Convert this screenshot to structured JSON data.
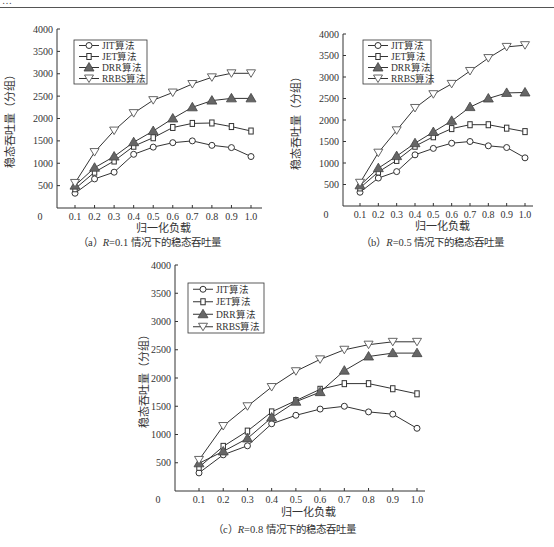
{
  "header": {
    "fragment": "…"
  },
  "legend_series": [
    "JIT算法",
    "JET算法",
    "DRR算法",
    "RRBS算法"
  ],
  "chart_data": [
    {
      "id": "a",
      "type": "line",
      "caption_prefix": "（a）",
      "caption_var": "R",
      "caption_rest": "=0.1 情况下的稳态吞吐量",
      "title": "(a) R=0.1 情况下的稳态吞吐量",
      "xlabel": "归一化负载",
      "ylabel": "稳态吞吐量（分组）",
      "x": [
        0.1,
        0.2,
        0.3,
        0.4,
        0.5,
        0.6,
        0.7,
        0.8,
        0.9,
        1.0
      ],
      "x_ticks": [
        "0.1",
        "0.2",
        "0.3",
        "0.4",
        "0.5",
        "0.6",
        "0.7",
        "0.8",
        "0.9",
        "1.0"
      ],
      "y_ticks": [
        "0",
        "500",
        "1000",
        "1500",
        "2000",
        "2500",
        "3000",
        "3500",
        "4000"
      ],
      "ylim": [
        0,
        4000
      ],
      "grid": false,
      "legend_position": "upper-left",
      "series": [
        {
          "name": "JIT算法",
          "marker": "circle",
          "values": [
            330,
            650,
            800,
            1200,
            1360,
            1460,
            1500,
            1400,
            1350,
            1150
          ]
        },
        {
          "name": "JET算法",
          "marker": "square",
          "values": [
            430,
            800,
            1050,
            1380,
            1570,
            1800,
            1890,
            1900,
            1820,
            1720
          ]
        },
        {
          "name": "DRR算法",
          "marker": "triangle-up",
          "values": [
            500,
            900,
            1150,
            1470,
            1720,
            2000,
            2250,
            2400,
            2450,
            2450
          ]
        },
        {
          "name": "RRBS算法",
          "marker": "triangle-down",
          "values": [
            560,
            1250,
            1730,
            2120,
            2410,
            2580,
            2770,
            2920,
            3010,
            3010
          ]
        }
      ]
    },
    {
      "id": "b",
      "type": "line",
      "caption_prefix": "（b）",
      "caption_var": "R",
      "caption_rest": "=0.5 情况下的稳态吞吐量",
      "title": "(b) R=0.5 情况下的稳态吞吐量",
      "xlabel": "归一化负载",
      "ylabel": "稳态吞吐量（分组）",
      "x": [
        0.1,
        0.2,
        0.3,
        0.4,
        0.5,
        0.6,
        0.7,
        0.8,
        0.9,
        1.0
      ],
      "x_ticks": [
        "0.1",
        "0.2",
        "0.3",
        "0.4",
        "0.5",
        "0.6",
        "0.7",
        "0.8",
        "0.9",
        "1.0"
      ],
      "y_ticks": [
        "0",
        "500",
        "1000",
        "1500",
        "2000",
        "2500",
        "3000",
        "3500",
        "4000"
      ],
      "ylim": [
        0,
        4000
      ],
      "grid": false,
      "legend_position": "upper-left",
      "series": [
        {
          "name": "JIT算法",
          "marker": "circle",
          "values": [
            320,
            650,
            800,
            1190,
            1340,
            1460,
            1500,
            1400,
            1360,
            1120
          ]
        },
        {
          "name": "JET算法",
          "marker": "square",
          "values": [
            420,
            790,
            1060,
            1390,
            1610,
            1800,
            1890,
            1890,
            1810,
            1730
          ]
        },
        {
          "name": "DRR算法",
          "marker": "triangle-up",
          "values": [
            480,
            880,
            1160,
            1460,
            1720,
            1980,
            2300,
            2500,
            2630,
            2640
          ]
        },
        {
          "name": "RRBS算法",
          "marker": "triangle-down",
          "values": [
            540,
            1240,
            1760,
            2280,
            2600,
            2840,
            3140,
            3440,
            3700,
            3740
          ]
        }
      ]
    },
    {
      "id": "c",
      "type": "line",
      "caption_prefix": "（c）",
      "caption_var": "R",
      "caption_rest": "=0.8 情况下的稳态吞吐量",
      "title": "(c) R=0.8 情况下的稳态吞吐量",
      "xlabel": "归一化负载",
      "ylabel": "稳态吞吐量（分组）",
      "x": [
        0.1,
        0.2,
        0.3,
        0.4,
        0.5,
        0.6,
        0.7,
        0.8,
        0.9,
        1.0
      ],
      "x_ticks": [
        "0.1",
        "0.2",
        "0.3",
        "0.4",
        "0.5",
        "0.6",
        "0.7",
        "0.8",
        "0.9",
        "1.0"
      ],
      "y_ticks": [
        "0",
        "500",
        "1000",
        "1500",
        "2000",
        "2500",
        "3000",
        "3500",
        "4000"
      ],
      "ylim": [
        0,
        4000
      ],
      "grid": false,
      "legend_position": "upper-left",
      "series": [
        {
          "name": "JIT算法",
          "marker": "circle",
          "values": [
            320,
            640,
            800,
            1190,
            1340,
            1450,
            1500,
            1400,
            1360,
            1110
          ]
        },
        {
          "name": "JET算法",
          "marker": "square",
          "values": [
            420,
            790,
            1060,
            1400,
            1600,
            1800,
            1900,
            1900,
            1810,
            1720
          ]
        },
        {
          "name": "DRR算法",
          "marker": "triangle-up",
          "values": [
            490,
            700,
            930,
            1300,
            1580,
            1750,
            2130,
            2380,
            2440,
            2440
          ]
        },
        {
          "name": "RRBS算法",
          "marker": "triangle-down",
          "values": [
            550,
            1150,
            1500,
            1840,
            2120,
            2330,
            2500,
            2590,
            2640,
            2640
          ]
        }
      ]
    }
  ]
}
